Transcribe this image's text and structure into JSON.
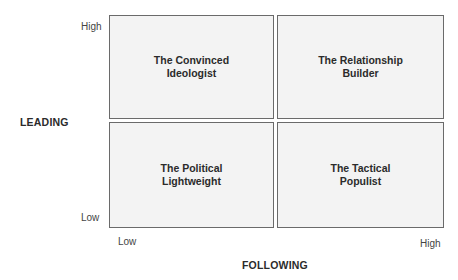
{
  "diagram": {
    "type": "2x2 matrix",
    "y_axis": {
      "title": "LEADING",
      "high_label": "High",
      "low_label": "Low"
    },
    "x_axis": {
      "title": "FOLLOWING",
      "low_label": "Low",
      "high_label": "High"
    },
    "quadrants": {
      "top_left": "The Convinced\nIdeologist",
      "top_right": "The Relationship\nBuilder",
      "bottom_left": "The Political\nLightweight",
      "bottom_right": "The Tactical\nPopulist"
    }
  }
}
